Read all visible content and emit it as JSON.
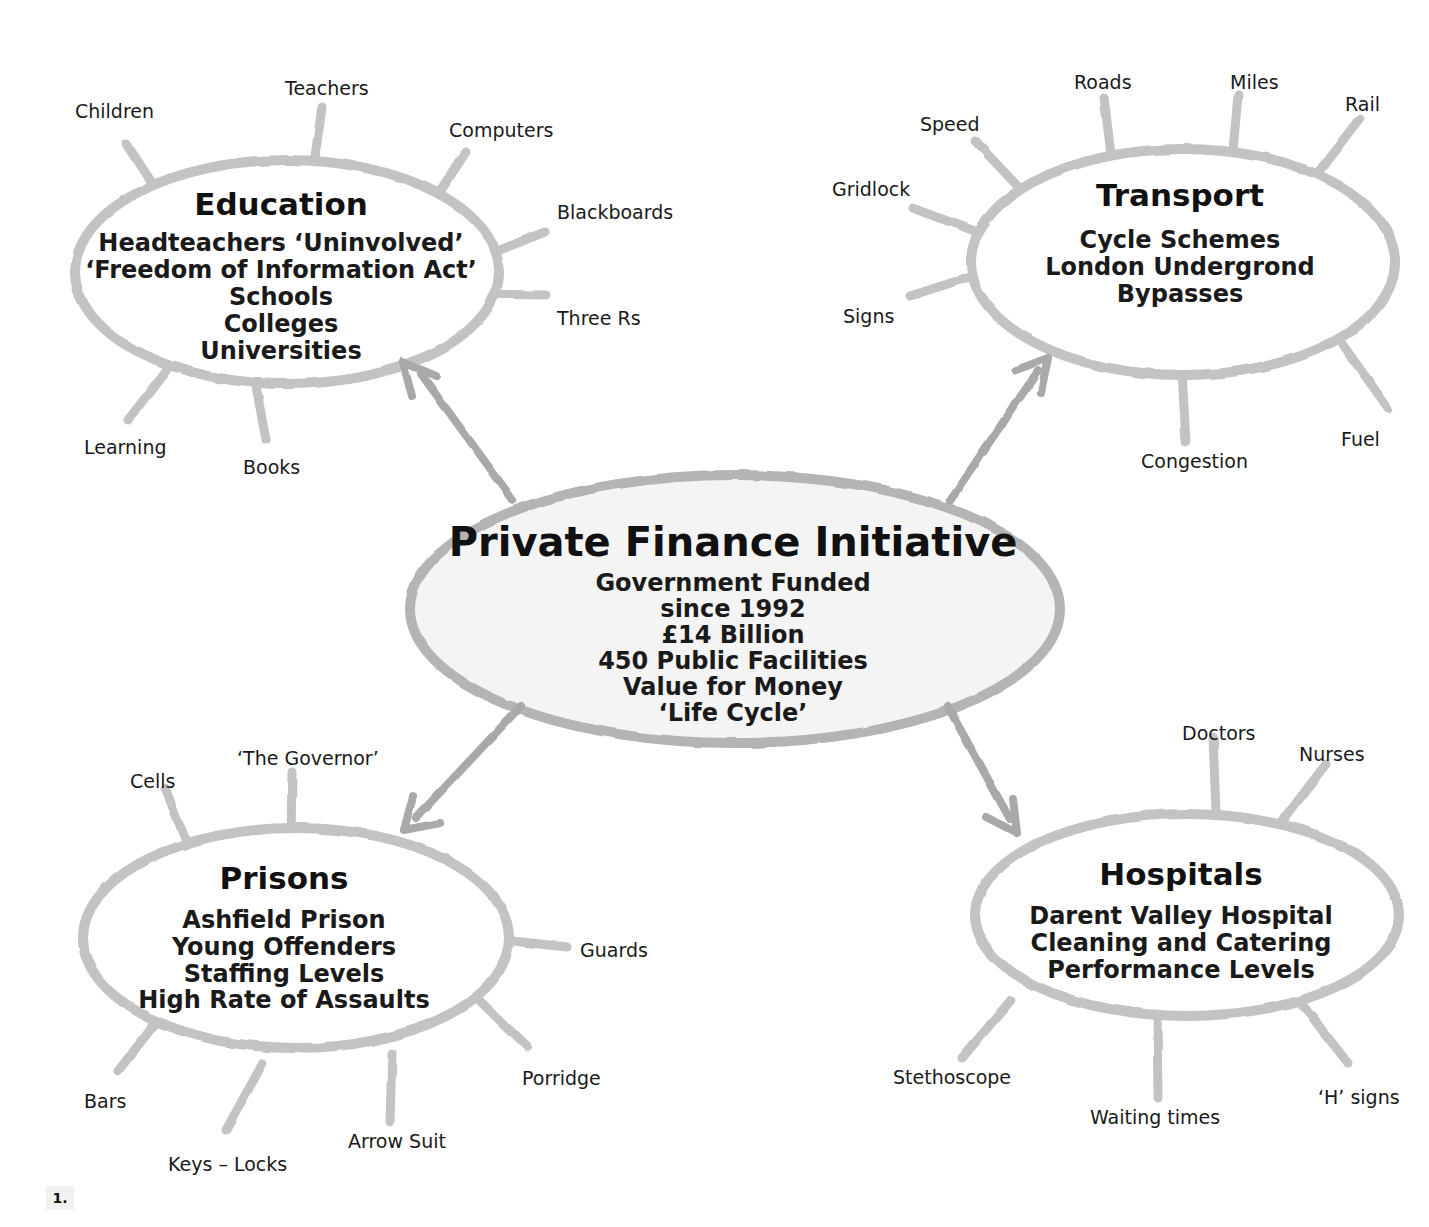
{
  "diagram": {
    "type": "mind-map",
    "page_marker": "1.",
    "colors": {
      "ellipse_stroke": "#c3c3c3",
      "spoke_stroke": "#c3c3c3",
      "arrow_stroke": "#a9a9a9",
      "center_fill": "#f4f4f4",
      "text": "#111111",
      "background": "#ffffff"
    }
  },
  "center": {
    "title": "Private Finance Initiative",
    "lines": [
      "Government Funded",
      "since 1992",
      "£14 Billion",
      "450 Public Facilities",
      "Value for Money",
      "‘Life Cycle’"
    ]
  },
  "branches": [
    {
      "id": "education",
      "title": "Education",
      "lines": [
        "Headteachers ‘Uninvolved’",
        "‘Freedom of Information Act’",
        "Schools",
        "Colleges",
        "Universities"
      ],
      "spokes": [
        "Children",
        "Teachers",
        "Computers",
        "Blackboards",
        "Three Rs",
        "Books",
        "Learning"
      ]
    },
    {
      "id": "transport",
      "title": "Transport",
      "lines": [
        "Cycle Schemes",
        "London Undergrond",
        "Bypasses"
      ],
      "spokes": [
        "Speed",
        "Roads",
        "Miles",
        "Rail",
        "Fuel",
        "Congestion",
        "Signs",
        "Gridlock"
      ]
    },
    {
      "id": "prisons",
      "title": "Prisons",
      "lines": [
        "Ashfield Prison",
        "Young Offenders",
        "Staffing Levels",
        "High Rate of Assaults"
      ],
      "spokes": [
        "Cells",
        "‘The Governor’",
        "Guards",
        "Porridge",
        "Arrow Suit",
        "Keys – Locks",
        "Bars"
      ]
    },
    {
      "id": "hospitals",
      "title": "Hospitals",
      "lines": [
        "Darent Valley Hospital",
        "Cleaning and Catering",
        "Performance Levels"
      ],
      "spokes": [
        "Doctors",
        "Nurses",
        "‘H’ signs",
        "Waiting times",
        "Stethoscope"
      ]
    }
  ]
}
